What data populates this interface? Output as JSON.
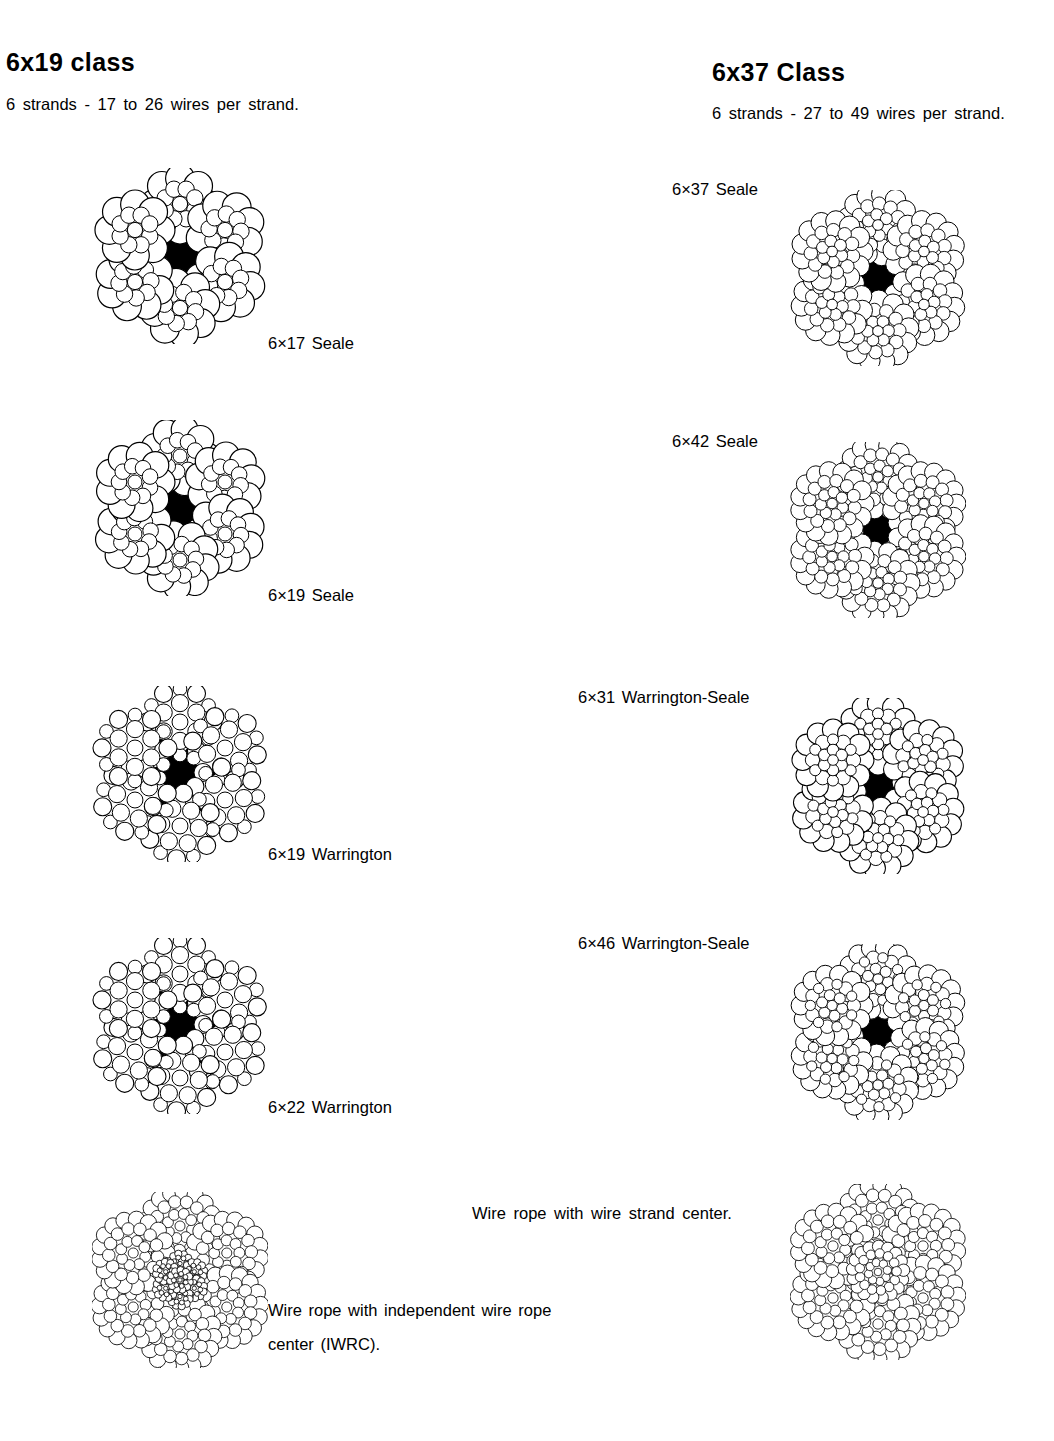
{
  "columns": {
    "left": {
      "heading": "6x19 class",
      "subtitle": "6 strands - 17 to 26 wires per strand."
    },
    "right": {
      "heading": "6x37  Class",
      "subtitle": "6 strands - 27 to 49 wires per strand."
    }
  },
  "left_figures": [
    {
      "label": "6×17  Seale"
    },
    {
      "label": "6×19  Seale"
    },
    {
      "label": "6×19  Warrington"
    },
    {
      "label": "6×22  Warrington"
    }
  ],
  "right_figures": [
    {
      "label": "6×37  Seale"
    },
    {
      "label": "6×42  Seale"
    },
    {
      "label": "6×31  Warrington-Seale"
    },
    {
      "label": "6×46  Warrington-Seale"
    }
  ],
  "captions": {
    "wire_strand_center": "Wire rope with wire strand center.",
    "iwrc_line1": "Wire rope with independent wire rope",
    "iwrc_line2": "center (IWRC)."
  },
  "colors": {
    "ink": "#000000",
    "core_fill": "#000000",
    "wire_fill": "#ffffff",
    "background": "#ffffff"
  },
  "diagram": {
    "type": "wire-rope-cross-section",
    "strand_count": 6,
    "core_types": [
      "fiber-core",
      "wire-strand-center",
      "independent-wire-rope-center"
    ]
  }
}
